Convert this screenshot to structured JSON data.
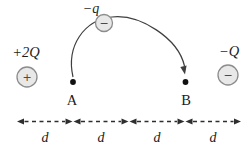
{
  "diagram": {
    "colors": {
      "background": "#ffffff",
      "line": "#3f3f3f",
      "dash": "#2e2e2e",
      "charge-fill": "#e8e8e8",
      "charge-stroke": "#8c8c8c",
      "sign": "#4a4a4a",
      "text": "#1c1c1c",
      "dot": "#111111"
    },
    "charges": {
      "left": {
        "label": "+2Q",
        "sign": "+"
      },
      "right": {
        "label": "−Q",
        "sign": "−"
      },
      "moving": {
        "label": "−q",
        "sign": "−"
      }
    },
    "points": {
      "a": "A",
      "b": "B"
    },
    "distance_labels": [
      "d",
      "d",
      "d",
      "d"
    ]
  }
}
